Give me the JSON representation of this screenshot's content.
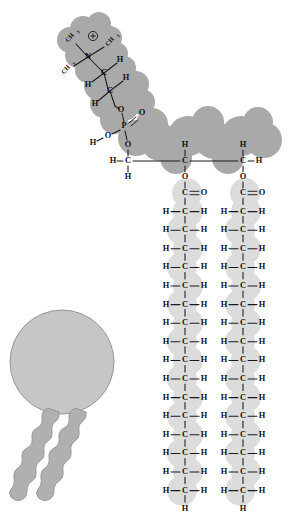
{
  "figure": {
    "type": "molecular-structure-diagram",
    "background_color": "#ffffff",
    "colors": {
      "hydrophilic_head_blob": "#a9a9a9",
      "hydrophobic_tail_blob": "#dcdcdc",
      "symbol_head": "#c6c6c6",
      "symbol_tail": "#b0b0b0",
      "bond_stroke": "#1a1a1a",
      "atom_label": "#111111"
    }
  },
  "structural_formula": {
    "head_group": {
      "name": "choline",
      "charge_symbol": "+",
      "nitrogen_label": "N",
      "methyl_labels": [
        "CH",
        "CH",
        "CH"
      ],
      "methyl_subscript": "3",
      "methyl_count": 3,
      "linker_carbons": [
        {
          "left": "H",
          "center": "C",
          "right": "H"
        },
        {
          "left": "H",
          "center": "C",
          "right": "H"
        }
      ]
    },
    "phosphate_group": {
      "phosphorus_label": "P",
      "double_bond_oxygen": "O",
      "hydroxyl_oxygen": "O",
      "hydroxyl_hydrogen": "H",
      "ester_oxygen_up": "O",
      "ester_oxygen_down": "O"
    },
    "glycerol_backbone": {
      "carbons": [
        {
          "left": "H",
          "center": "C",
          "right": "",
          "below": "H",
          "above": "O"
        },
        {
          "left": "",
          "center": "C",
          "right": "",
          "above": "H",
          "below": "O"
        },
        {
          "left": "",
          "center": "C",
          "right": "H",
          "above": "H",
          "below": "O"
        }
      ]
    },
    "fatty_acid_chains": [
      {
        "id": "chain-1",
        "carbonyl": {
          "carbon": "C",
          "oxygen": "O",
          "bond": "double"
        },
        "methylene_label": {
          "left": "H",
          "center": "C",
          "right": "H"
        },
        "methylene_count": 16,
        "terminal_hydrogen": "H"
      },
      {
        "id": "chain-2",
        "carbonyl": {
          "carbon": "C",
          "oxygen": "O",
          "bond": "double"
        },
        "methylene_label": {
          "left": "H",
          "center": "C",
          "right": "H"
        },
        "methylene_count": 16,
        "terminal_hydrogen": "H"
      }
    ]
  },
  "simplified_symbol": {
    "head_shape": "circle",
    "tail_shape": "wavy-line",
    "tail_count": 2
  }
}
